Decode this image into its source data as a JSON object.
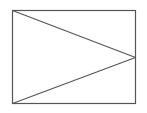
{
  "diagram": {
    "stroke_color": "#555555",
    "background": "#ffffff",
    "rect": {
      "x": 12,
      "y": 10,
      "width": 123,
      "height": 93
    },
    "lines": [
      {
        "x1": 12,
        "y1": 10,
        "x2": 135,
        "y2": 57
      },
      {
        "x1": 12,
        "y1": 103,
        "x2": 135,
        "y2": 57
      }
    ]
  }
}
